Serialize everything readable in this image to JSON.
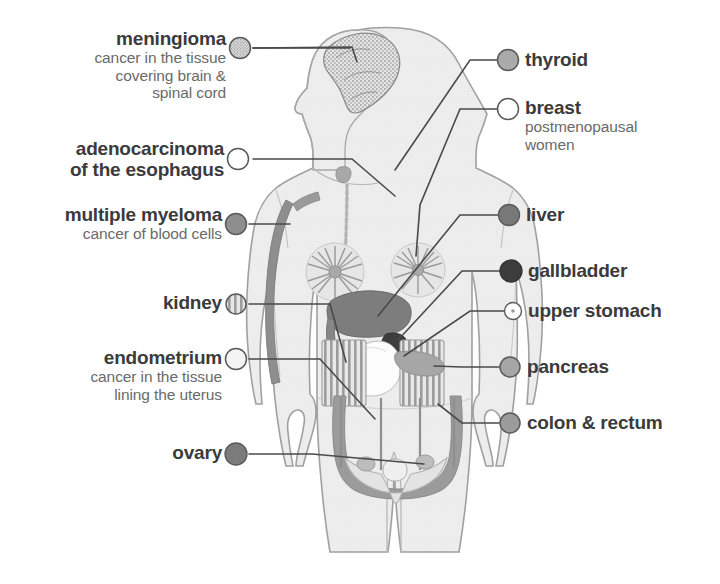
{
  "diagram": {
    "figure": "female human body, front view, head in profile facing left, shown from head to mid-thigh",
    "colors": {
      "body_fill": "#ededed",
      "body_outline": "#9a9a9a",
      "organ_mid": "#8e8e8e",
      "organ_dark": "#6f6f6f",
      "organ_darkest": "#3d3d3d",
      "organ_light": "#b9b9b9",
      "leader_line": "#4a4a4a",
      "text_title": "#3b3b3b",
      "text_sub": "#6a6a6a"
    }
  },
  "left_labels": [
    {
      "id": "meningioma",
      "title": "meningioma",
      "sub": [
        "cancer in the tissue",
        "covering brain &",
        "spinal cord"
      ],
      "marker": "stippled",
      "marker_color": "#cfcfcf",
      "target": "brain"
    },
    {
      "id": "adenocarcinoma-esophagus",
      "title": "adenocarcinoma",
      "sub": [
        "of the esophagus"
      ],
      "title_lines": [
        "adenocarcinoma",
        "of the esophagus"
      ],
      "marker": "open",
      "marker_color": "#ffffff",
      "target": "esophagus"
    },
    {
      "id": "multiple-myeloma",
      "title": "multiple myeloma",
      "sub": [
        "cancer of blood cells"
      ],
      "marker": "solid",
      "marker_color": "#8e8e8e",
      "target": "bone-marrow"
    },
    {
      "id": "kidney",
      "title": "kidney",
      "sub": [],
      "marker": "striped",
      "marker_color": "#d2d2d2",
      "target": "kidneys"
    },
    {
      "id": "endometrium",
      "title": "endometrium",
      "sub": [
        "cancer in the tissue",
        "lining the uterus"
      ],
      "marker": "open",
      "marker_color": "#f2f2f2",
      "target": "uterus"
    },
    {
      "id": "ovary",
      "title": "ovary",
      "sub": [],
      "marker": "solid",
      "marker_color": "#7b7b7b",
      "target": "ovaries"
    }
  ],
  "right_labels": [
    {
      "id": "thyroid",
      "title": "thyroid",
      "sub": [],
      "marker": "solid",
      "marker_color": "#aaaaaa",
      "target": "thyroid-gland"
    },
    {
      "id": "breast",
      "title": "breast",
      "sub": [
        "postmenopausal",
        "women"
      ],
      "marker": "open",
      "marker_color": "#ffffff",
      "target": "breast"
    },
    {
      "id": "liver",
      "title": "liver",
      "sub": [],
      "marker": "solid",
      "marker_color": "#787878",
      "target": "liver"
    },
    {
      "id": "gallbladder",
      "title": "gallbladder",
      "sub": [],
      "marker": "solid",
      "marker_color": "#3d3d3d",
      "target": "gallbladder"
    },
    {
      "id": "upper-stomach",
      "title": "upper stomach",
      "sub": [],
      "marker": "open-dot",
      "marker_color": "#ffffff",
      "target": "stomach"
    },
    {
      "id": "pancreas",
      "title": "pancreas",
      "sub": [],
      "marker": "solid",
      "marker_color": "#a6a6a6",
      "target": "pancreas"
    },
    {
      "id": "colon-rectum",
      "title": "colon & rectum",
      "sub": [],
      "marker": "solid",
      "marker_color": "#9b9b9b",
      "target": "colon"
    }
  ]
}
